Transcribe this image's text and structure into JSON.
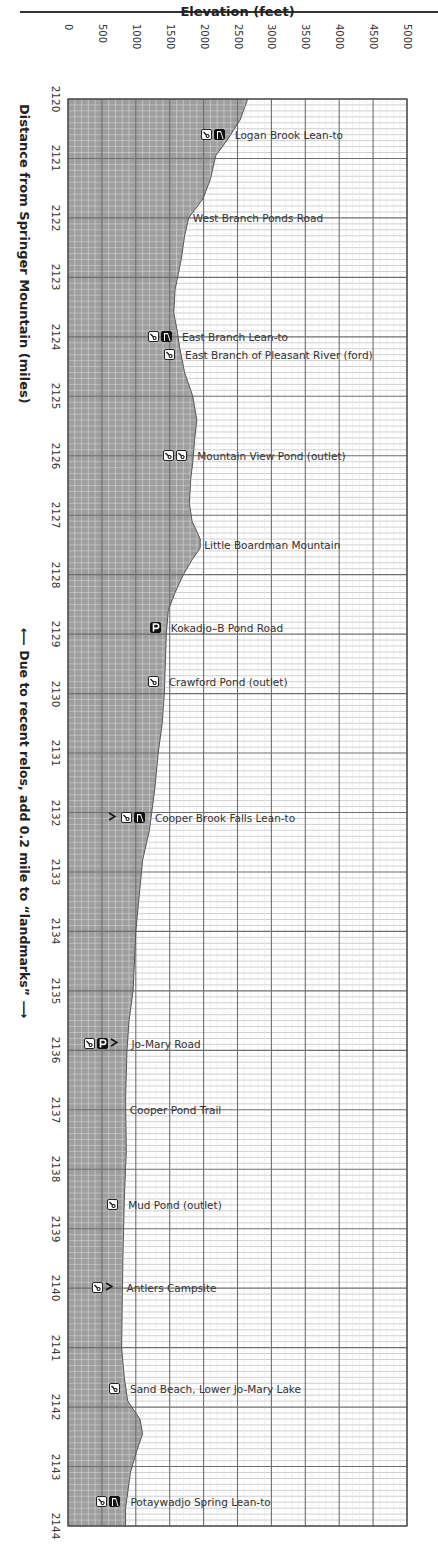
{
  "page": {
    "page_number": "",
    "note_vertical": "⟵ Due to recent relos, add 0.2 mile to “landmarks” ⟶"
  },
  "chart_data": {
    "type": "area",
    "title": "",
    "xlabel": "Elevation (feet)",
    "ylabel": "Distance from Springer Mountain (miles)",
    "orientation": "vertical-profile (distance runs down, elevation runs right)",
    "xlim": [
      0,
      5000
    ],
    "ylim": [
      2120,
      2144
    ],
    "x_ticks": [
      "0",
      "500",
      "1000",
      "1500",
      "2000",
      "2500",
      "3000",
      "3500",
      "4000",
      "4500",
      "5000"
    ],
    "y_ticks": [
      "2120",
      "2121",
      "2122",
      "2123",
      "2124",
      "2125",
      "2126",
      "2127",
      "2128",
      "2129",
      "2130",
      "2131",
      "2132",
      "2133",
      "2134",
      "2135",
      "2136",
      "2137",
      "2138",
      "2139",
      "2140",
      "2141",
      "2142",
      "2143",
      "2144"
    ],
    "grid": true,
    "note": "Due to recent relos, add 0.2 mile to “landmarks”",
    "profile": [
      {
        "mile": 2120.0,
        "elev": 2650
      },
      {
        "mile": 2120.35,
        "elev": 2540
      },
      {
        "mile": 2120.69,
        "elev": 2350
      },
      {
        "mile": 2120.95,
        "elev": 2180
      },
      {
        "mile": 2121.35,
        "elev": 2100
      },
      {
        "mile": 2121.68,
        "elev": 1990
      },
      {
        "mile": 2122.0,
        "elev": 1780
      },
      {
        "mile": 2122.3,
        "elev": 1720
      },
      {
        "mile": 2122.7,
        "elev": 1670
      },
      {
        "mile": 2123.2,
        "elev": 1580
      },
      {
        "mile": 2123.6,
        "elev": 1560
      },
      {
        "mile": 2123.9,
        "elev": 1610
      },
      {
        "mile": 2124.2,
        "elev": 1650
      },
      {
        "mile": 2124.6,
        "elev": 1720
      },
      {
        "mile": 2125.0,
        "elev": 1840
      },
      {
        "mile": 2125.4,
        "elev": 1900
      },
      {
        "mile": 2125.7,
        "elev": 1870
      },
      {
        "mile": 2126.1,
        "elev": 1840
      },
      {
        "mile": 2126.4,
        "elev": 1810
      },
      {
        "mile": 2126.8,
        "elev": 1790
      },
      {
        "mile": 2127.1,
        "elev": 1830
      },
      {
        "mile": 2127.4,
        "elev": 1950
      },
      {
        "mile": 2127.55,
        "elev": 1950
      },
      {
        "mile": 2127.75,
        "elev": 1830
      },
      {
        "mile": 2128.0,
        "elev": 1700
      },
      {
        "mile": 2128.3,
        "elev": 1580
      },
      {
        "mile": 2128.6,
        "elev": 1480
      },
      {
        "mile": 2129.0,
        "elev": 1450
      },
      {
        "mile": 2130.0,
        "elev": 1420
      },
      {
        "mile": 2130.5,
        "elev": 1390
      },
      {
        "mile": 2131.0,
        "elev": 1330
      },
      {
        "mile": 2131.6,
        "elev": 1280
      },
      {
        "mile": 2132.3,
        "elev": 1200
      },
      {
        "mile": 2132.8,
        "elev": 1100
      },
      {
        "mile": 2133.4,
        "elev": 1050
      },
      {
        "mile": 2134.0,
        "elev": 1000
      },
      {
        "mile": 2135.0,
        "elev": 960
      },
      {
        "mile": 2135.5,
        "elev": 900
      },
      {
        "mile": 2136.0,
        "elev": 870
      },
      {
        "mile": 2136.8,
        "elev": 850
      },
      {
        "mile": 2137.7,
        "elev": 860
      },
      {
        "mile": 2138.5,
        "elev": 830
      },
      {
        "mile": 2139.5,
        "elev": 810
      },
      {
        "mile": 2140.3,
        "elev": 800
      },
      {
        "mile": 2141.0,
        "elev": 790
      },
      {
        "mile": 2141.5,
        "elev": 830
      },
      {
        "mile": 2141.9,
        "elev": 880
      },
      {
        "mile": 2142.2,
        "elev": 1060
      },
      {
        "mile": 2142.45,
        "elev": 1100
      },
      {
        "mile": 2142.75,
        "elev": 1010
      },
      {
        "mile": 2143.1,
        "elev": 920
      },
      {
        "mile": 2143.7,
        "elev": 850
      },
      {
        "mile": 2144.0,
        "elev": 850
      }
    ],
    "landmarks": [
      {
        "mile": 2120.6,
        "label": "Logan Brook Lean-to",
        "icons": [
          "water",
          "shelter"
        ]
      },
      {
        "mile": 2122.0,
        "label": "West Branch Ponds Road",
        "icons": []
      },
      {
        "mile": 2124.0,
        "label": "East Branch Lean-to",
        "icons": [
          "water",
          "shelter"
        ]
      },
      {
        "mile": 2124.3,
        "label": "East Branch of Pleasant River (ford)",
        "icons": [
          "water"
        ]
      },
      {
        "mile": 2126.0,
        "label": "Mountain View Pond (outlet)",
        "icons": [
          "water",
          "water"
        ]
      },
      {
        "mile": 2127.5,
        "label": "Little Boardman Mountain",
        "icons": []
      },
      {
        "mile": 2128.9,
        "label": "Kokadjo–B Pond Road",
        "icons": [
          "parking"
        ]
      },
      {
        "mile": 2129.8,
        "label": "Crawford Pond (outlet)",
        "icons": [
          "water"
        ]
      },
      {
        "mile": 2132.1,
        "label": "Cooper Brook Falls Lean-to",
        "icons": [
          "camp",
          "water",
          "shelter"
        ]
      },
      {
        "mile": 2135.9,
        "label": "Jo-Mary Road",
        "icons": [
          "water",
          "parking",
          "camp"
        ]
      },
      {
        "mile": 2137.0,
        "label": "Cooper Pond Trail",
        "icons": []
      },
      {
        "mile": 2138.6,
        "label": "Mud Pond (outlet)",
        "icons": [
          "water"
        ]
      },
      {
        "mile": 2140.0,
        "label": "Antlers Campsite",
        "icons": [
          "water",
          "camp"
        ]
      },
      {
        "mile": 2141.7,
        "label": "Sand Beach, Lower Jo-Mary Lake",
        "icons": [
          "water"
        ]
      },
      {
        "mile": 2143.6,
        "label": "Potaywadjo Spring Lean-to",
        "icons": [
          "water",
          "shelter"
        ]
      }
    ]
  },
  "colors": {
    "fill": "#9e9e9e",
    "fill_grid": "#8a8a8a",
    "grid_major": "#6e6e6e",
    "grid_minor": "#c4c4c4",
    "background": "#ffffff",
    "profile_line": "#555555"
  }
}
